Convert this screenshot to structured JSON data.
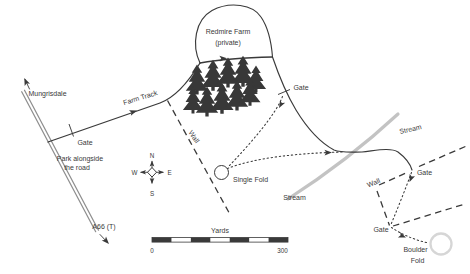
{
  "labels": {
    "mungrisdale": "Mungrisdale",
    "farm_track": "Farm Track",
    "redmire_line1": "Redmire Farm",
    "redmire_line2": "(private)",
    "gate": "Gate",
    "park_line1": "Park alongside",
    "park_line2": "the road",
    "a66": "A66 (T)",
    "wall": "Wall",
    "stream": "Stream",
    "single_fold": "Single Fold",
    "boulder_line1": "Boulder",
    "boulder_line2": "Fold"
  },
  "compass": {
    "n": "N",
    "e": "E",
    "s": "S",
    "w": "W"
  },
  "scale_bar": {
    "unit_label": "Yards",
    "min": "0",
    "max": "300",
    "segments": 7
  },
  "colors": {
    "ink": "#3a3a3a",
    "road": "#8f8f8f",
    "stream": "#c3c3c3",
    "tree": "#383838",
    "fold_ring": "#d6d6d6",
    "background": "#ffffff"
  }
}
